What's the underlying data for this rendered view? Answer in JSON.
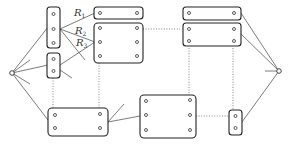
{
  "diagram": {
    "labels": {
      "r1": {
        "main": "R",
        "sub": "1"
      },
      "r2": {
        "main": "R",
        "sub": "2"
      },
      "r3": {
        "main": "R",
        "sub": "3"
      }
    },
    "colors": {
      "stroke": "#222222",
      "background": "#ffffff"
    },
    "nodes": [
      {
        "id": "source",
        "x": 12,
        "y": 73
      },
      {
        "id": "sink",
        "x": 279,
        "y": 71
      }
    ],
    "blocks": [
      {
        "id": "A",
        "x": 47,
        "y": 7,
        "w": 13,
        "h": 41,
        "ports": 3
      },
      {
        "id": "B",
        "x": 47,
        "y": 53,
        "w": 13,
        "h": 25,
        "ports": 2
      },
      {
        "id": "C",
        "x": 94,
        "y": 7,
        "w": 49,
        "h": 12,
        "ports": 2
      },
      {
        "id": "D",
        "x": 94,
        "y": 23,
        "w": 49,
        "h": 40,
        "ports": 6
      },
      {
        "id": "E",
        "x": 183,
        "y": 7,
        "w": 58,
        "h": 13,
        "ports": 2
      },
      {
        "id": "F",
        "x": 183,
        "y": 23,
        "w": 58,
        "h": 23,
        "ports": 4
      },
      {
        "id": "G",
        "x": 48,
        "y": 108,
        "w": 60,
        "h": 28,
        "ports": 4
      },
      {
        "id": "H",
        "x": 140,
        "y": 95,
        "w": 56,
        "h": 43,
        "ports": 6
      },
      {
        "id": "I",
        "x": 229,
        "y": 110,
        "w": 13,
        "h": 25,
        "ports": 2
      }
    ]
  }
}
